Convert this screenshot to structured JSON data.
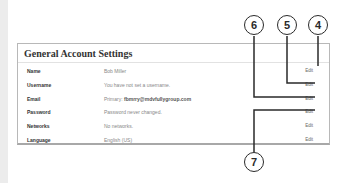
{
  "panel": {
    "title": "General Account Settings",
    "rows": [
      {
        "label": "Name",
        "value": "Bob Miller",
        "edit": "Edit"
      },
      {
        "label": "Username",
        "value": "You have not set a username.",
        "edit": "Edit"
      },
      {
        "label": "Email",
        "value_prefix": "Primary: ",
        "value_strong": "fbmrry@mdvfullygroup.com",
        "edit": "Edit"
      },
      {
        "label": "Password",
        "value": "Password never changed.",
        "edit": "Edit"
      },
      {
        "label": "Networks",
        "value": "No networks.",
        "edit": "Edit"
      },
      {
        "label": "Language",
        "value": "English (US)",
        "edit": "Edit"
      }
    ]
  },
  "callouts": [
    {
      "number": "4",
      "target": "Name Edit"
    },
    {
      "number": "5",
      "target": "Username Edit"
    },
    {
      "number": "6",
      "target": "Email Edit"
    },
    {
      "number": "7",
      "target": "Password Edit"
    }
  ],
  "colors": {
    "panel_border": "#b8b8b8",
    "callout_line": "#2a2a2a",
    "label_text": "#333333",
    "value_text": "#888888"
  }
}
